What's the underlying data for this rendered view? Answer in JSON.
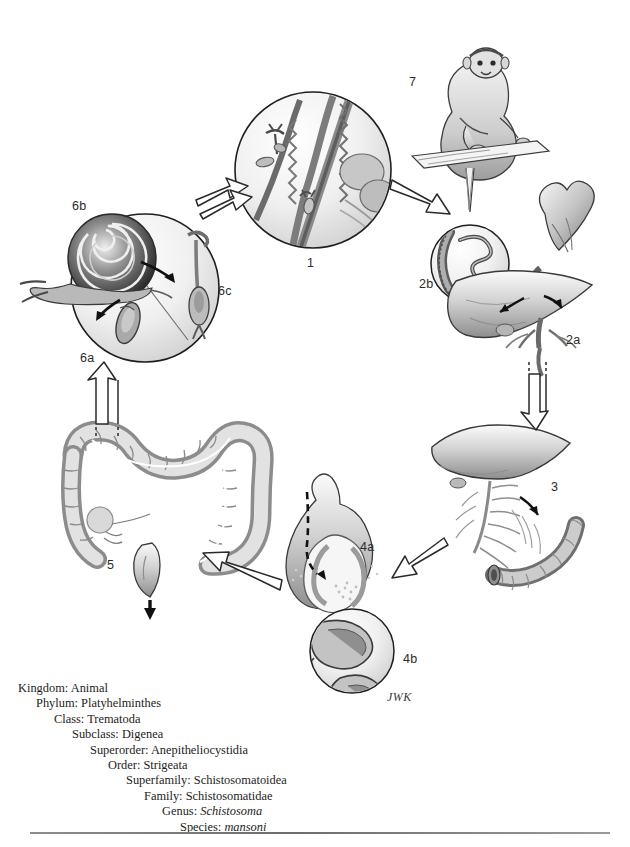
{
  "figure": {
    "signature": "JWK",
    "palette": {
      "ink": "#2b2b2b",
      "line": "#3a3a3a",
      "fill_light": "#f2f2f2",
      "fill_mid": "#c9c9c9",
      "fill_dark": "#8f8f8f",
      "rule": "#7a7a7a"
    }
  },
  "stages": [
    {
      "id": "1",
      "label": "1",
      "name": "cercariae-penetrating-skin",
      "x": 307,
      "y": 256
    },
    {
      "id": "2b",
      "label": "2b",
      "name": "adult-worm-pair-in-vessel",
      "x": 419,
      "y": 277
    },
    {
      "id": "2a",
      "label": "2a",
      "name": "heart-and-liver",
      "x": 566,
      "y": 333
    },
    {
      "id": "3",
      "label": "3",
      "name": "mesenteric-vessels-intestine",
      "x": 551,
      "y": 480
    },
    {
      "id": "4a",
      "label": "4a",
      "name": "egg-crossing-intestinal-wall",
      "x": 360,
      "y": 540
    },
    {
      "id": "4b",
      "label": "4b",
      "name": "schistosome-eggs-detail",
      "x": 403,
      "y": 658
    },
    {
      "id": "5",
      "label": "5",
      "name": "large-intestine-egg-release",
      "x": 107,
      "y": 564
    },
    {
      "id": "6a",
      "label": "6a",
      "name": "miracidium",
      "x": 80,
      "y": 357
    },
    {
      "id": "6b",
      "label": "6b",
      "name": "snail-intermediate-host",
      "x": 72,
      "y": 205
    },
    {
      "id": "6c",
      "label": "6c",
      "name": "cercaria-forked-tail",
      "x": 218,
      "y": 290
    },
    {
      "id": "7",
      "label": "7",
      "name": "primate-definitive-host",
      "x": 409,
      "y": 81
    }
  ],
  "taxonomy": {
    "rows": [
      {
        "rank": "Kingdom:",
        "value": "Animal",
        "italic": false,
        "indent": 0
      },
      {
        "rank": "Phylum:",
        "value": "Platyhelminthes",
        "italic": false,
        "indent": 1
      },
      {
        "rank": "Class:",
        "value": "Trematoda",
        "italic": false,
        "indent": 2
      },
      {
        "rank": "Subclass:",
        "value": "Digenea",
        "italic": false,
        "indent": 3
      },
      {
        "rank": "Superorder:",
        "value": "Anepitheliocystidia",
        "italic": false,
        "indent": 4
      },
      {
        "rank": "Order:",
        "value": "Strigeata",
        "italic": false,
        "indent": 5
      },
      {
        "rank": "Superfamily:",
        "value": "Schistosomatoidea",
        "italic": false,
        "indent": 6
      },
      {
        "rank": "Family:",
        "value": "Schistosomatidae",
        "italic": false,
        "indent": 7
      },
      {
        "rank": "Genus:",
        "value": "Schistosoma",
        "italic": true,
        "indent": 8
      },
      {
        "rank": "Species:",
        "value": "mansoni",
        "italic": true,
        "indent": 9
      }
    ]
  }
}
